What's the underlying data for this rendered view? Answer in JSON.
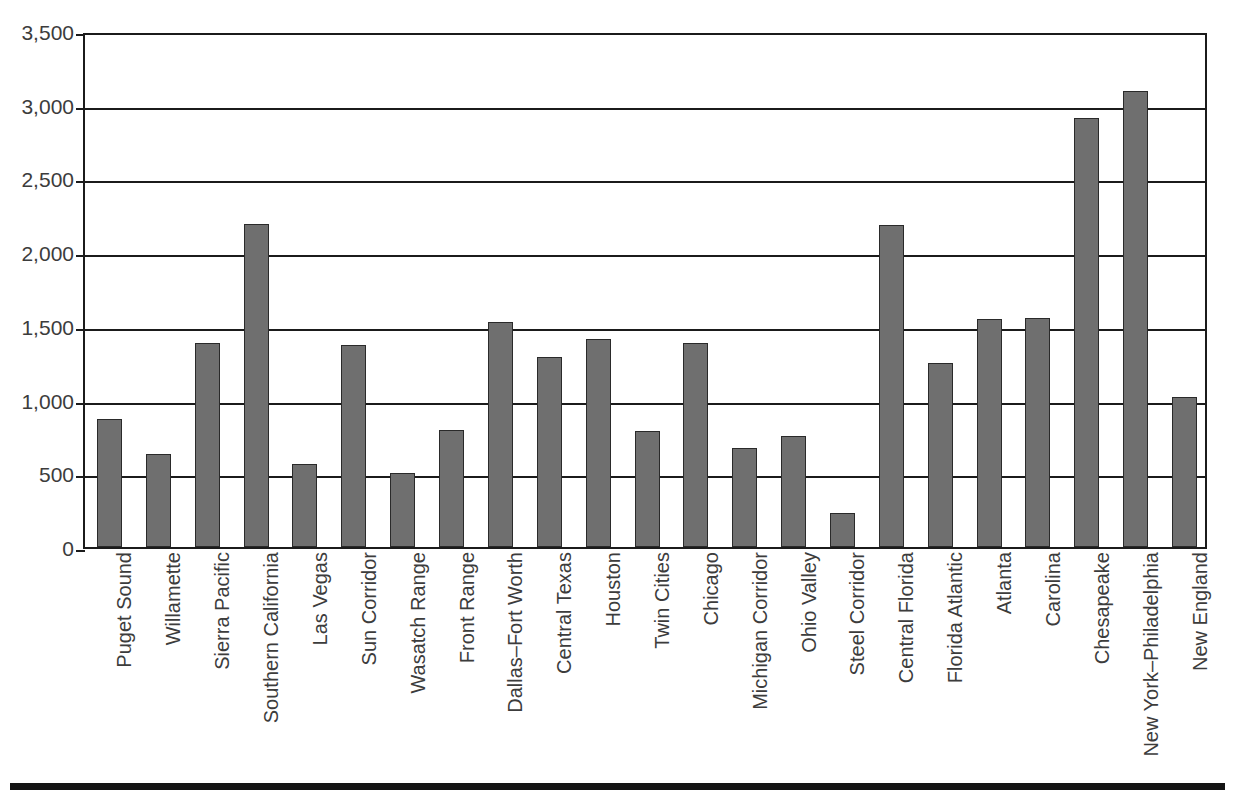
{
  "chart_data": {
    "type": "bar",
    "title": "",
    "subtitle": "",
    "xlabel": "",
    "ylabel": "",
    "ylim": [
      0,
      3500
    ],
    "ytick_labels": [
      "0",
      "500",
      "1,000",
      "1,500",
      "2,000",
      "2,500",
      "3,000",
      "3,500"
    ],
    "ytick_values": [
      0,
      500,
      1000,
      1500,
      2000,
      2500,
      3000,
      3500
    ],
    "grid": "horizontal",
    "legend": "none",
    "bar_color": "#6f6f6f",
    "bar_edge_color": "#2a2a2a",
    "axis_color": "#1b1b1b",
    "categories": [
      "Puget Sound",
      "Willamette",
      "Sierra Pacific",
      "Southern California",
      "Las Vegas",
      "Sun Corridor",
      "Wasatch Range",
      "Front Range",
      "Dallas–Fort Worth",
      "Central Texas",
      "Houston",
      "Twin Cities",
      "Chicago",
      "Michigan Corridor",
      "Ohio Valley",
      "Steel Corridor",
      "Central Florida",
      "Florida Atlantic",
      "Atlanta",
      "Carolina",
      "Chesapeake",
      "New York–Philadelphia",
      "New England"
    ],
    "values": [
      865,
      630,
      1385,
      2190,
      565,
      1370,
      500,
      795,
      1525,
      1290,
      1410,
      790,
      1385,
      675,
      755,
      230,
      2185,
      1250,
      1545,
      1555,
      2910,
      3090,
      1020
    ]
  }
}
